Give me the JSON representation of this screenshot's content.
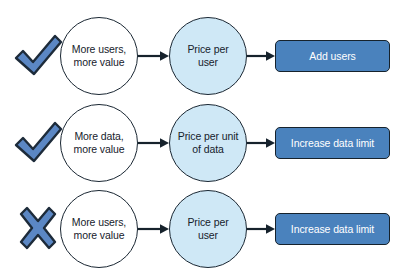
{
  "diagram": {
    "background_color": "#ffffff",
    "marker_fill_color": "#5b87c4",
    "marker_stroke_color": "#1d2b3a",
    "circle_source_color": "#ffffff",
    "circle_metric_color": "#cfe8f6",
    "button_color": "#4a82bd",
    "button_border_color": "#16222c",
    "button_text_color": "#ffffff",
    "outline_color": "#1a2733",
    "rows": [
      {
        "marker": "check-icon",
        "source_line1": "More users,",
        "source_line2": "more value",
        "metric_line1": "Price per",
        "metric_line2": "user",
        "action": "Add users"
      },
      {
        "marker": "check-icon",
        "source_line1": "More data,",
        "source_line2": "more value",
        "metric_line1": "Price per unit",
        "metric_line2": "of data",
        "action": "Increase data limit"
      },
      {
        "marker": "x-icon",
        "source_line1": "More users,",
        "source_line2": "more value",
        "metric_line1": "Price per",
        "metric_line2": "user",
        "action": "Increase data limit"
      }
    ]
  }
}
